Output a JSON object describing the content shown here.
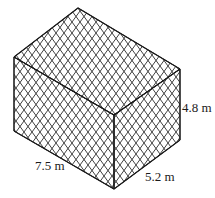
{
  "figure": {
    "type": "rectangular-prism-net-pattern",
    "dimensions": {
      "length": "7.5 m",
      "width": "5.2 m",
      "height": "4.8 m"
    },
    "colors": {
      "edge": "#1a1a1a",
      "mesh": "#2a2a2a",
      "background": "#ffffff"
    }
  }
}
